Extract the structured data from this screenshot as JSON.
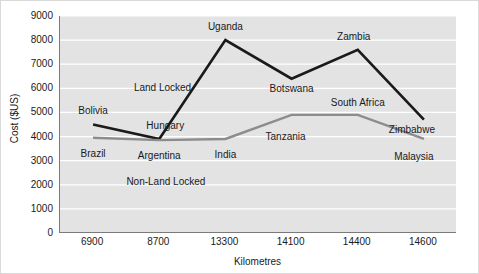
{
  "chart_data": {
    "type": "line",
    "title": "",
    "xlabel": "Kilometres",
    "ylabel": "Cost ($US)",
    "categories": [
      "6900",
      "8700",
      "13300",
      "14100",
      "14400",
      "14600"
    ],
    "ylim": [
      0,
      9000
    ],
    "y_ticks": [
      0,
      1000,
      2000,
      3000,
      4000,
      5000,
      6000,
      7000,
      8000,
      9000
    ],
    "grid": true,
    "legend": "none",
    "series": [
      {
        "name": "Land Locked",
        "color": "#1a1a1a",
        "values": [
          4500,
          3900,
          8000,
          6400,
          7600,
          4700
        ],
        "point_labels": [
          "Bolivia",
          "Hungary",
          "Uganda",
          "Botswana",
          "Zambia",
          "Zimbabwe"
        ]
      },
      {
        "name": "Non-Land Locked",
        "color": "#8c8c8c",
        "values": [
          3950,
          3850,
          3900,
          4900,
          4900,
          3900
        ],
        "point_labels": [
          "Brazil",
          "Argentina",
          "India",
          "Tanzania",
          "South Africa",
          "Malaysia"
        ]
      }
    ],
    "annotations": [
      {
        "text": "Land Locked",
        "x_index": 1.05,
        "y": 6000
      },
      {
        "text": "Non-Land Locked",
        "x_index": 1.1,
        "y": 2100
      }
    ]
  },
  "labels": {
    "land_locked": [
      "Bolivia",
      "Hungary",
      "Uganda",
      "Botswana",
      "Zambia",
      "Zimbabwe"
    ],
    "non_land_locked": [
      "Brazil",
      "Argentina",
      "India",
      "Tanzania",
      "South Africa",
      "Malaysia"
    ]
  }
}
